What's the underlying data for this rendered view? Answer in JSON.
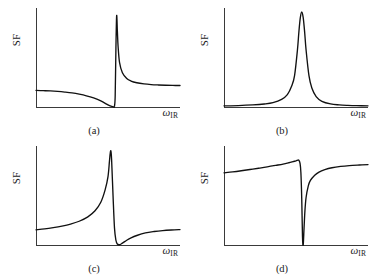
{
  "figure": {
    "background": "#ffffff",
    "curve_color": "#111111",
    "axis_color": "#3a3a3a",
    "grid": false,
    "layout": "2x2"
  },
  "chart_data": [
    {
      "type": "line",
      "title": "",
      "panel_label": "(a)",
      "xlabel": "ω",
      "xlabel_sub": "IR",
      "ylabel": "SF",
      "legend": "none",
      "grid": false,
      "axis_ticks": false,
      "xlim": [
        0,
        1
      ],
      "ylim": [
        0,
        1
      ],
      "description": "Asymmetric Fano lineshape: flat low background, shallow dip to zero, then sharp tall peak decaying to an elevated plateau",
      "model": "fano",
      "params": {
        "nonres": 0.3,
        "amp": 1.0,
        "phase_deg": 170,
        "center": 0.56,
        "width": 0.022
      },
      "x": [
        0.0,
        0.05,
        0.1,
        0.15,
        0.2,
        0.25,
        0.3,
        0.35,
        0.4,
        0.45,
        0.5,
        0.52,
        0.54,
        0.545,
        0.55,
        0.555,
        0.56,
        0.565,
        0.57,
        0.58,
        0.6,
        0.63,
        0.66,
        0.7,
        0.75,
        0.8,
        0.85,
        0.9,
        0.95,
        1.0
      ],
      "y": [
        0.175,
        0.172,
        0.169,
        0.164,
        0.157,
        0.148,
        0.135,
        0.118,
        0.095,
        0.064,
        0.022,
        0.008,
        0.0,
        0.01,
        0.12,
        0.62,
        0.96,
        0.8,
        0.64,
        0.47,
        0.36,
        0.3,
        0.273,
        0.255,
        0.243,
        0.236,
        0.232,
        0.229,
        0.227,
        0.226
      ]
    },
    {
      "type": "line",
      "title": "",
      "panel_label": "(b)",
      "xlabel": "ω",
      "xlabel_sub": "IR",
      "ylabel": "SF",
      "legend": "none",
      "grid": false,
      "axis_ticks": false,
      "xlim": [
        0,
        1
      ],
      "ylim": [
        0,
        1
      ],
      "description": "Symmetric Lorentzian resonance peak on a zero background",
      "model": "lorentzian",
      "params": {
        "nonres": 0.0,
        "amp": 1.0,
        "phase_deg": 0,
        "center": 0.54,
        "width": 0.03
      },
      "x": [
        0.0,
        0.1,
        0.2,
        0.28,
        0.34,
        0.4,
        0.44,
        0.47,
        0.49,
        0.51,
        0.52,
        0.53,
        0.54,
        0.55,
        0.56,
        0.57,
        0.59,
        0.61,
        0.64,
        0.68,
        0.74,
        0.8,
        0.86,
        0.92,
        1.0
      ],
      "y": [
        0.012,
        0.015,
        0.022,
        0.032,
        0.046,
        0.08,
        0.13,
        0.22,
        0.33,
        0.6,
        0.79,
        0.94,
        1.0,
        0.94,
        0.79,
        0.6,
        0.33,
        0.2,
        0.11,
        0.06,
        0.032,
        0.022,
        0.017,
        0.014,
        0.012
      ]
    },
    {
      "type": "line",
      "title": "",
      "panel_label": "(c)",
      "xlabel": "ω",
      "xlabel_sub": "IR",
      "ylabel": "SF",
      "legend": "none",
      "grid": false,
      "axis_ticks": false,
      "xlim": [
        0,
        1
      ],
      "ylim": [
        0,
        1
      ],
      "description": "Asymmetric Fano lineshape: gradual rise from low plateau to a sharp tall peak, sudden drop into a dip at zero, then slow recovery to a modest plateau",
      "model": "fano",
      "params": {
        "nonres": 0.3,
        "amp": 1.0,
        "phase_deg": 10,
        "center": 0.52,
        "width": 0.022
      },
      "x": [
        0.0,
        0.06,
        0.12,
        0.18,
        0.24,
        0.3,
        0.36,
        0.41,
        0.45,
        0.48,
        0.5,
        0.51,
        0.515,
        0.52,
        0.525,
        0.535,
        0.545,
        0.555,
        0.565,
        0.58,
        0.6,
        0.63,
        0.66,
        0.7,
        0.76,
        0.82,
        0.88,
        0.94,
        1.0
      ],
      "y": [
        0.16,
        0.17,
        0.183,
        0.199,
        0.22,
        0.25,
        0.296,
        0.36,
        0.45,
        0.58,
        0.72,
        0.88,
        0.96,
        0.99,
        0.9,
        0.52,
        0.18,
        0.05,
        0.01,
        0.003,
        0.02,
        0.05,
        0.075,
        0.1,
        0.127,
        0.142,
        0.152,
        0.158,
        0.162
      ]
    },
    {
      "type": "line",
      "title": "",
      "panel_label": "(d)",
      "xlabel": "ω",
      "xlabel_sub": "IR",
      "ylabel": "SF",
      "legend": "none",
      "grid": false,
      "axis_ticks": false,
      "xlim": [
        0,
        1
      ],
      "ylim": [
        0,
        1
      ],
      "description": "Inverted resonance: high plateau rising to a small bump, then a sharp narrow dip down to zero, followed by gradual recovery to the plateau",
      "model": "fano",
      "params": {
        "nonres": 0.75,
        "amp": -1.0,
        "phase_deg": 0,
        "center": 0.545,
        "width": 0.02
      },
      "x": [
        0.0,
        0.06,
        0.12,
        0.18,
        0.24,
        0.3,
        0.36,
        0.41,
        0.45,
        0.48,
        0.5,
        0.51,
        0.515,
        0.52,
        0.528,
        0.534,
        0.54,
        0.545,
        0.55,
        0.556,
        0.562,
        0.57,
        0.585,
        0.6,
        0.63,
        0.66,
        0.7,
        0.75,
        0.81,
        0.87,
        0.94,
        1.0
      ],
      "y": [
        0.76,
        0.77,
        0.782,
        0.795,
        0.808,
        0.822,
        0.838,
        0.852,
        0.866,
        0.878,
        0.886,
        0.892,
        0.894,
        0.892,
        0.86,
        0.76,
        0.48,
        0.09,
        0.0,
        0.18,
        0.36,
        0.5,
        0.62,
        0.68,
        0.735,
        0.768,
        0.793,
        0.813,
        0.827,
        0.836,
        0.842,
        0.846
      ]
    }
  ]
}
